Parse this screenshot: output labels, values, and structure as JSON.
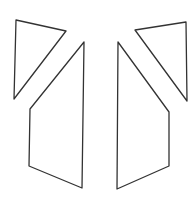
{
  "diagram": {
    "stroke_color": "#333333",
    "fill_color": "#ffffff",
    "stroke_width": 1.3,
    "shapes": [
      {
        "name": "left-triangle",
        "type": "triangle",
        "points": "16,20 66,31 14,99"
      },
      {
        "name": "right-triangle",
        "type": "triangle",
        "points": "135,30 186,22 187,101"
      },
      {
        "name": "left-quadrilateral",
        "type": "quadrilateral",
        "points": "84,42 30,109 29,166 82,188"
      },
      {
        "name": "right-quadrilateral",
        "type": "quadrilateral",
        "points": "118,42 169,112 169,166 117,189"
      }
    ]
  }
}
